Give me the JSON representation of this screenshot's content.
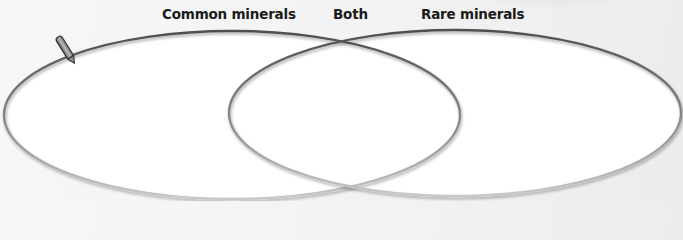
{
  "diagram": {
    "type": "venn",
    "labels": {
      "left": "Common minerals",
      "middle": "Both",
      "right": "Rare minerals"
    },
    "sets": [
      {
        "name": "Common minerals",
        "items": []
      },
      {
        "name": "Rare minerals",
        "items": []
      }
    ],
    "intersection": {
      "name": "Both",
      "items": []
    },
    "icons": [
      "pencil-icon"
    ],
    "colors": {
      "stroke_top": "#4f4f4f",
      "stroke_bottom": "#c4c4c4",
      "fill": "#ffffff",
      "background": "#f2f2f2",
      "label": "#1a1a1a"
    }
  }
}
